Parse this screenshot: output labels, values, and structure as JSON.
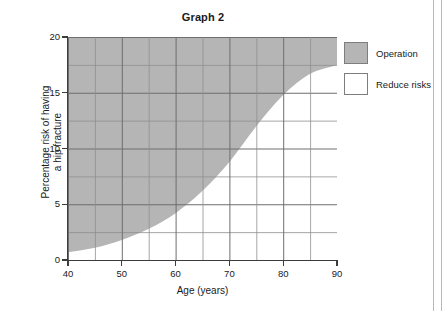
{
  "chart_data": {
    "type": "area",
    "title": "Graph 2",
    "xlabel": "Age (years)",
    "ylabel": "Percentage risk of having a hip fracture",
    "ylabel_line1": "Percentage risk of having",
    "ylabel_line2": "a hip fracture",
    "xlim": [
      40,
      90
    ],
    "ylim": [
      0,
      20
    ],
    "xticks": [
      40,
      50,
      60,
      70,
      80,
      90
    ],
    "yticks": [
      0,
      5,
      10,
      15,
      20
    ],
    "x_minor_step": 5,
    "y_minor_step": 2.5,
    "grid": true,
    "legend_position": "right",
    "series": [
      {
        "name": "Operation",
        "color": "#b5b5b5",
        "description": "Shaded region above the risk curve (upper band)"
      },
      {
        "name": "Reduce risks",
        "color": "#ffffff",
        "description": "Unshaded region below the risk curve (lower band)"
      }
    ],
    "boundary_curve": {
      "name": "Percentage risk of having a hip fracture",
      "x": [
        40,
        45,
        50,
        55,
        60,
        65,
        70,
        75,
        80,
        85,
        90
      ],
      "y": [
        0.7,
        1.1,
        1.8,
        2.8,
        4.2,
        6.2,
        8.8,
        12.0,
        14.8,
        16.7,
        17.5
      ]
    },
    "plateau_value": 17.5,
    "annotations": []
  },
  "legend": {
    "items": [
      {
        "label": "Operation",
        "color": "#b5b5b5"
      },
      {
        "label": "Reduce risks",
        "color": "#ffffff"
      }
    ]
  },
  "axes": {
    "x_tick_labels": [
      "40",
      "50",
      "60",
      "70",
      "80",
      "90"
    ],
    "y_tick_labels": [
      "0",
      "5",
      "10",
      "15",
      "20"
    ]
  }
}
